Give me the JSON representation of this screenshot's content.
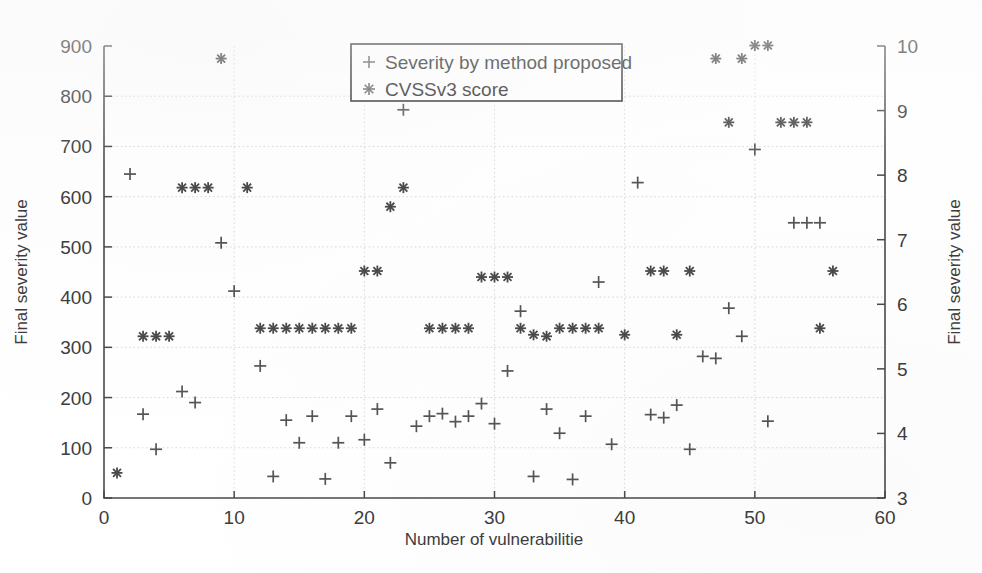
{
  "figure": {
    "background": "#ffffff",
    "ink_color": "#4a4a4a",
    "grid_color": "#c9c9c9"
  },
  "chart_data": {
    "type": "scatter",
    "title": "",
    "xlabel": "Number of vulnerabilitie",
    "ylabel": "Final severity value",
    "ylabel_right": "Final severity value",
    "xlim": [
      0,
      60
    ],
    "ylim": [
      0,
      900
    ],
    "ylim_right": [
      3,
      10
    ],
    "xticks": [
      0,
      10,
      20,
      30,
      40,
      50,
      60
    ],
    "yticks": [
      0,
      100,
      200,
      300,
      400,
      500,
      600,
      700,
      800,
      900
    ],
    "yticks_right": [
      3,
      4,
      5,
      6,
      7,
      8,
      9,
      10
    ],
    "grid": true,
    "legend_position": "top-center",
    "series": [
      {
        "name": "Severity by method proposed",
        "marker": "+",
        "axis": "left",
        "color": "#555555",
        "x": [
          2,
          3,
          4,
          6,
          7,
          9,
          10,
          12,
          13,
          14,
          15,
          16,
          17,
          18,
          19,
          20,
          21,
          22,
          23,
          24,
          25,
          26,
          27,
          28,
          29,
          30,
          31,
          32,
          33,
          34,
          35,
          36,
          37,
          38,
          39,
          41,
          42,
          43,
          44,
          45,
          46,
          47,
          48,
          49,
          50,
          51,
          53,
          54,
          55
        ],
        "y": [
          645,
          167,
          97,
          212,
          190,
          508,
          412,
          263,
          43,
          155,
          110,
          163,
          38,
          110,
          163,
          116,
          177,
          70,
          773,
          143,
          163,
          168,
          152,
          163,
          188,
          148,
          253,
          372,
          43,
          177,
          129,
          37,
          163,
          430,
          107,
          628,
          166,
          160,
          185,
          97,
          282,
          278,
          378,
          322,
          694,
          153,
          548,
          548,
          548
        ],
        "note_left_axis": "left-axis values, 0 to 900"
      },
      {
        "name": "CVSSv3 score",
        "marker": "*",
        "axis": "right",
        "color": "#4a4a4a",
        "x": [
          1,
          3,
          4,
          5,
          6,
          7,
          8,
          9,
          11,
          12,
          13,
          14,
          15,
          16,
          17,
          18,
          19,
          20,
          21,
          22,
          23,
          25,
          26,
          27,
          28,
          29,
          30,
          31,
          32,
          33,
          34,
          35,
          36,
          37,
          38,
          40,
          42,
          43,
          44,
          45,
          47,
          48,
          49,
          50,
          51,
          52,
          53,
          54,
          55,
          56
        ],
        "y_left_equivalent": [
          50,
          322,
          322,
          322,
          618,
          618,
          618,
          875,
          618,
          338,
          338,
          338,
          338,
          338,
          338,
          338,
          338,
          452,
          452,
          580,
          618,
          338,
          338,
          338,
          338,
          440,
          440,
          440,
          338,
          325,
          322,
          338,
          338,
          338,
          338,
          325,
          452,
          452,
          325,
          452,
          875,
          748,
          875,
          901,
          901,
          748,
          748,
          748,
          338,
          452
        ],
        "note_right_axis": "plotted against right axis (3 to 10); left-axis pixel equivalents given"
      }
    ],
    "special_points": {
      "x1_star_low": 50,
      "x2_plus_high": 645,
      "x9_star_top": 875,
      "x23_plus_peak": 773,
      "x51_52_star_max": 901
    }
  },
  "legend": {
    "entries": [
      {
        "marker": "+",
        "label": "Severity by method proposed"
      },
      {
        "marker": "*",
        "label": "CVSSv3 score"
      }
    ]
  },
  "axes": {
    "x_title": "Number of vulnerabilitie",
    "y_left_title": "Final severity value",
    "y_right_title": "Final severity value",
    "x_tick_labels": [
      "0",
      "10",
      "20",
      "30",
      "40",
      "50",
      "60"
    ],
    "y_left_tick_labels": [
      "0",
      "100",
      "200",
      "300",
      "400",
      "500",
      "600",
      "700",
      "800",
      "900"
    ],
    "y_right_tick_labels": [
      "3",
      "4",
      "5",
      "6",
      "7",
      "8",
      "9",
      "10"
    ]
  }
}
